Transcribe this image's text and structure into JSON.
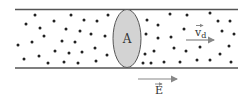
{
  "diagram": {
    "cross_section_label": "A",
    "drift_velocity_label": "v",
    "drift_velocity_subscript": "d",
    "field_label": "E",
    "colors": {
      "wire_line": "#555555",
      "cross_section_fill": "#d3d3d3",
      "cross_section_stroke": "#555555",
      "dot": "#222222",
      "arrow": "#888888"
    },
    "dots": [
      [
        35,
        15
      ],
      [
        26,
        24
      ],
      [
        40,
        28
      ],
      [
        54,
        21
      ],
      [
        71,
        15
      ],
      [
        84,
        20
      ],
      [
        97,
        21
      ],
      [
        108,
        15
      ],
      [
        66,
        29
      ],
      [
        80,
        31
      ],
      [
        44,
        36
      ],
      [
        91,
        34
      ],
      [
        105,
        36
      ],
      [
        18,
        45
      ],
      [
        32,
        42
      ],
      [
        62,
        41
      ],
      [
        75,
        42
      ],
      [
        55,
        51
      ],
      [
        69,
        53
      ],
      [
        82,
        52
      ],
      [
        95,
        48
      ],
      [
        24,
        59
      ],
      [
        39,
        56
      ],
      [
        48,
        63
      ],
      [
        64,
        62
      ],
      [
        78,
        63
      ],
      [
        96,
        61
      ],
      [
        107,
        55
      ],
      [
        147,
        20
      ],
      [
        158,
        25
      ],
      [
        170,
        14
      ],
      [
        187,
        15
      ],
      [
        210,
        13
      ],
      [
        218,
        21
      ],
      [
        230,
        21
      ],
      [
        146,
        34
      ],
      [
        158,
        38
      ],
      [
        171,
        37
      ],
      [
        184,
        29
      ],
      [
        222,
        31
      ],
      [
        234,
        34
      ],
      [
        145,
        54
      ],
      [
        154,
        51
      ],
      [
        174,
        48
      ],
      [
        186,
        51
      ],
      [
        200,
        47
      ],
      [
        229,
        46
      ],
      [
        143,
        63
      ],
      [
        151,
        63
      ],
      [
        164,
        62
      ],
      [
        180,
        62
      ],
      [
        197,
        60
      ],
      [
        210,
        60
      ],
      [
        220,
        54
      ],
      [
        231,
        62
      ]
    ]
  }
}
